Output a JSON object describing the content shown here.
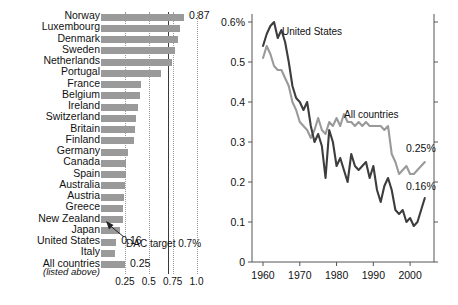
{
  "chart_data": [
    {
      "id": "aid-bar-chart",
      "type": "bar",
      "orientation": "horizontal",
      "title": "",
      "xlabel": "",
      "ylabel": "",
      "xlim": [
        0,
        1.1
      ],
      "xticks": [
        0.25,
        0.5,
        0.75,
        1.0
      ],
      "xtick_labels": [
        "0.25",
        "0.5",
        "0.75",
        "1.0"
      ],
      "grid": "vertical-dotted",
      "units": "% of GNI",
      "categories": [
        "Norway",
        "Luxembourg",
        "Denmark",
        "Sweden",
        "Netherlands",
        "Portugal",
        "France",
        "Belgium",
        "Ireland",
        "Switzerland",
        "Britain",
        "Finland",
        "Germany",
        "Canada",
        "Spain",
        "Australia",
        "Austria",
        "Greece",
        "New Zealand",
        "Japan",
        "United States",
        "Italy",
        "All countries"
      ],
      "values": [
        0.87,
        0.83,
        0.81,
        0.78,
        0.74,
        0.63,
        0.42,
        0.41,
        0.39,
        0.37,
        0.36,
        0.35,
        0.28,
        0.26,
        0.26,
        0.25,
        0.24,
        0.23,
        0.23,
        0.2,
        0.16,
        0.15,
        0.25
      ],
      "value_labels": {
        "Norway": "0.87",
        "United States": "0.16",
        "All countries": "0.25"
      },
      "subnote": "(listed above)",
      "annotations": [
        {
          "text": "DAC target 0.7%",
          "value": 0.7,
          "type": "reference-line-with-arrow"
        }
      ],
      "bar_color": "#9a9a9a",
      "reference_line_color": "#3a3a3a"
    },
    {
      "id": "aid-trend-line-chart",
      "type": "line",
      "title": "",
      "xlabel": "",
      "ylabel": "",
      "ylim": [
        0,
        0.62
      ],
      "xlim": [
        1957,
        2006
      ],
      "yticks": [
        0,
        0.1,
        0.2,
        0.3,
        0.4,
        0.5,
        0.6
      ],
      "ytick_labels": [
        "0",
        "0.1",
        "0.2",
        "0.3",
        "0.4",
        "0.5",
        "0.6%"
      ],
      "xticks": [
        1960,
        1970,
        1980,
        1990,
        2000
      ],
      "xtick_labels": [
        "1960",
        "1970",
        "1980",
        "1990",
        "2000"
      ],
      "grid": "off",
      "legend_position": "inline-annotation",
      "series": [
        {
          "name": "United States",
          "color": "#3d3d3d",
          "end_label": "0.16%",
          "x": [
            1960,
            1961,
            1962,
            1963,
            1964,
            1965,
            1966,
            1967,
            1968,
            1969,
            1970,
            1971,
            1972,
            1973,
            1974,
            1975,
            1976,
            1977,
            1978,
            1979,
            1980,
            1981,
            1982,
            1983,
            1984,
            1985,
            1986,
            1987,
            1988,
            1989,
            1990,
            1991,
            1992,
            1993,
            1994,
            1995,
            1996,
            1997,
            1998,
            1999,
            2000,
            2001,
            2002,
            2003,
            2004
          ],
          "values": [
            0.54,
            0.57,
            0.59,
            0.6,
            0.56,
            0.58,
            0.55,
            0.5,
            0.44,
            0.41,
            0.4,
            0.38,
            0.4,
            0.34,
            0.3,
            0.32,
            0.29,
            0.21,
            0.33,
            0.3,
            0.24,
            0.26,
            0.23,
            0.2,
            0.27,
            0.24,
            0.23,
            0.24,
            0.25,
            0.21,
            0.24,
            0.18,
            0.15,
            0.19,
            0.21,
            0.18,
            0.13,
            0.12,
            0.13,
            0.1,
            0.11,
            0.09,
            0.1,
            0.13,
            0.16
          ]
        },
        {
          "name": "All countries",
          "color": "#9a9a9a",
          "end_label": "0.25%",
          "x": [
            1960,
            1961,
            1962,
            1963,
            1964,
            1965,
            1966,
            1967,
            1968,
            1969,
            1970,
            1971,
            1972,
            1973,
            1974,
            1975,
            1976,
            1977,
            1978,
            1979,
            1980,
            1981,
            1982,
            1983,
            1984,
            1985,
            1986,
            1987,
            1988,
            1989,
            1990,
            1991,
            1992,
            1993,
            1994,
            1995,
            1996,
            1997,
            1998,
            1999,
            2000,
            2001,
            2002,
            2003,
            2004
          ],
          "values": [
            0.51,
            0.54,
            0.52,
            0.49,
            0.48,
            0.48,
            0.46,
            0.44,
            0.4,
            0.38,
            0.35,
            0.34,
            0.33,
            0.31,
            0.33,
            0.36,
            0.33,
            0.32,
            0.35,
            0.34,
            0.36,
            0.34,
            0.37,
            0.35,
            0.35,
            0.34,
            0.35,
            0.34,
            0.35,
            0.34,
            0.34,
            0.34,
            0.34,
            0.33,
            0.34,
            0.27,
            0.25,
            0.22,
            0.23,
            0.24,
            0.22,
            0.22,
            0.23,
            0.24,
            0.25
          ]
        }
      ]
    }
  ],
  "barchart": {
    "rows": [
      {
        "label": "Norway",
        "value": 0.87,
        "value_label": "0.87"
      },
      {
        "label": "Luxembourg",
        "value": 0.83,
        "value_label": ""
      },
      {
        "label": "Denmark",
        "value": 0.81,
        "value_label": ""
      },
      {
        "label": "Sweden",
        "value": 0.78,
        "value_label": ""
      },
      {
        "label": "Netherlands",
        "value": 0.74,
        "value_label": ""
      },
      {
        "label": "Portugal",
        "value": 0.63,
        "value_label": ""
      },
      {
        "label": "France",
        "value": 0.42,
        "value_label": ""
      },
      {
        "label": "Belgium",
        "value": 0.41,
        "value_label": ""
      },
      {
        "label": "Ireland",
        "value": 0.39,
        "value_label": ""
      },
      {
        "label": "Switzerland",
        "value": 0.37,
        "value_label": ""
      },
      {
        "label": "Britain",
        "value": 0.36,
        "value_label": ""
      },
      {
        "label": "Finland",
        "value": 0.35,
        "value_label": ""
      },
      {
        "label": "Germany",
        "value": 0.28,
        "value_label": ""
      },
      {
        "label": "Canada",
        "value": 0.26,
        "value_label": ""
      },
      {
        "label": "Spain",
        "value": 0.26,
        "value_label": ""
      },
      {
        "label": "Australia",
        "value": 0.25,
        "value_label": ""
      },
      {
        "label": "Austria",
        "value": 0.24,
        "value_label": ""
      },
      {
        "label": "Greece",
        "value": 0.23,
        "value_label": ""
      },
      {
        "label": "New Zealand",
        "value": 0.23,
        "value_label": ""
      },
      {
        "label": "Japan",
        "value": 0.2,
        "value_label": ""
      },
      {
        "label": "United States",
        "value": 0.16,
        "value_label": "0.16"
      },
      {
        "label": "Italy",
        "value": 0.15,
        "value_label": ""
      },
      {
        "label": "All countries",
        "value": 0.25,
        "value_label": "0.25"
      }
    ],
    "subnote": "(listed above)",
    "ticks": [
      "0.25",
      "0.5",
      "0.75",
      "1.0"
    ],
    "tick_values": [
      0.25,
      0.5,
      0.75,
      1.0
    ],
    "target": {
      "value": 0.7,
      "label": "DAC target 0.7%"
    }
  },
  "linechart": {
    "ytick_labels": [
      "0.6%",
      "0.5",
      "0.4",
      "0.3",
      "0.2",
      "0.1",
      "0"
    ],
    "ytick_values": [
      0.6,
      0.5,
      0.4,
      0.3,
      0.2,
      0.1,
      0
    ],
    "xtick_labels": [
      "1960",
      "1970",
      "1980",
      "1990",
      "2000"
    ],
    "xtick_values": [
      1960,
      1970,
      1980,
      1990,
      2000
    ],
    "series_labels": {
      "us": "United States",
      "all": "All countries"
    },
    "end_labels": {
      "all": "0.25%",
      "us": "0.16%"
    }
  },
  "colors": {
    "bar": "#9a9a9a",
    "us_line": "#3d3d3d",
    "all_line": "#9a9a9a",
    "reference_line": "#3a3a3a",
    "grid": "#9b9b9b",
    "axis": "#555555",
    "text": "#111111"
  }
}
